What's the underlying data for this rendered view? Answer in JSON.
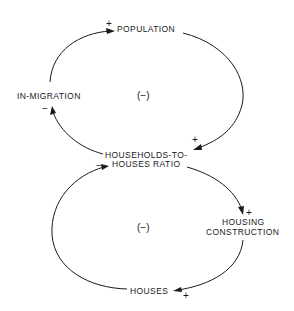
{
  "diagram": {
    "type": "causal-loop-diagram",
    "nodes": {
      "population": "POPULATION",
      "in_migration": "IN-MIGRATION",
      "ratio_line1": "HOUSEHOLDS-TO-",
      "ratio_line2": "HOUSES RATIO",
      "construction_line1": "HOUSING",
      "construction_line2": "CONSTRUCTION",
      "houses": "HOUSES"
    },
    "loops": {
      "upper": "(−)",
      "lower": "(−)"
    },
    "links": [
      {
        "from": "IN-MIGRATION",
        "to": "POPULATION",
        "polarity": "+"
      },
      {
        "from": "POPULATION",
        "to": "HOUSEHOLDS-TO-HOUSES RATIO",
        "polarity": "+"
      },
      {
        "from": "HOUSEHOLDS-TO-HOUSES RATIO",
        "to": "IN-MIGRATION",
        "polarity": "−"
      },
      {
        "from": "HOUSEHOLDS-TO-HOUSES RATIO",
        "to": "HOUSING CONSTRUCTION",
        "polarity": "+"
      },
      {
        "from": "HOUSING CONSTRUCTION",
        "to": "HOUSES",
        "polarity": "+"
      },
      {
        "from": "HOUSES",
        "to": "HOUSEHOLDS-TO-HOUSES RATIO",
        "polarity": "−"
      }
    ],
    "colors": {
      "ink": "#1a1a1a",
      "background": "#ffffff"
    }
  }
}
